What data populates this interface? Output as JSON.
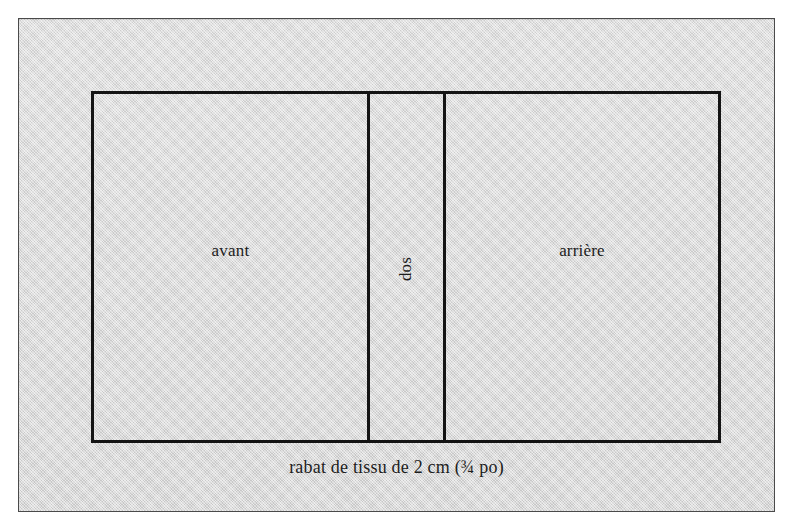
{
  "diagram": {
    "panel": {
      "name": "rabat de tissu",
      "fill_color": "#d8d8d8",
      "border_color": "#4a4a4a"
    },
    "cut_piece": {
      "border_color": "#141414",
      "sections": [
        {
          "id": "front",
          "label": "avant",
          "orientation": "horizontal"
        },
        {
          "id": "spine",
          "label": "dos",
          "orientation": "vertical-ccw"
        },
        {
          "id": "back",
          "label": "arrière",
          "orientation": "horizontal"
        }
      ]
    },
    "caption": "rabat de tissu de 2 cm (¾ po)"
  }
}
